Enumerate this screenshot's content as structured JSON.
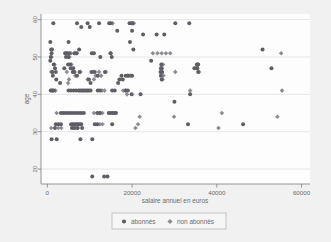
{
  "figure": {
    "background_color": "#f1f1f1",
    "plot_background_color": "#fdfdfd"
  },
  "axes": {
    "x_title": "salaire annuel en euros",
    "y_title": "age",
    "x_ticks": [
      "0",
      "20000",
      "40000",
      "60000"
    ],
    "y_ticks": [
      "20",
      "30",
      "40",
      "50",
      "60"
    ]
  },
  "legend": {
    "items": [
      {
        "label": "abonnés",
        "marker": "circle",
        "color": "#5e5e66"
      },
      {
        "label": "non abonnés",
        "marker": "diamond",
        "color": "#8c8c92"
      }
    ]
  },
  "chart_data": {
    "type": "scatter",
    "title": "",
    "xlabel": "salaire annuel en euros",
    "ylabel": "age",
    "xlim": [
      -1500,
      62000
    ],
    "ylim": [
      16,
      61.5
    ],
    "xticks": [
      0,
      20000,
      40000,
      60000
    ],
    "yticks": [
      20,
      30,
      40,
      50,
      60
    ],
    "grid": "horizontal",
    "legend_position": "below-axis",
    "series": [
      {
        "name": "abonnés",
        "marker": "circle",
        "color": "#5e5e66",
        "points": [
          [
            1400,
            59
          ],
          [
            7000,
            59
          ],
          [
            9500,
            59
          ],
          [
            12200,
            59
          ],
          [
            14600,
            59
          ],
          [
            15000,
            59
          ],
          [
            19400,
            59
          ],
          [
            19900,
            59
          ],
          [
            20100,
            59
          ],
          [
            30200,
            59
          ],
          [
            33500,
            59
          ],
          [
            8000,
            58
          ],
          [
            10000,
            58
          ],
          [
            16500,
            57
          ],
          [
            20000,
            57
          ],
          [
            22600,
            56
          ],
          [
            25800,
            56
          ],
          [
            27600,
            56
          ],
          [
            700,
            54
          ],
          [
            5000,
            54
          ],
          [
            19500,
            54
          ],
          [
            900,
            52
          ],
          [
            1100,
            52
          ],
          [
            7500,
            52
          ],
          [
            20300,
            52
          ],
          [
            50800,
            52
          ],
          [
            1000,
            51
          ],
          [
            4200,
            51
          ],
          [
            4600,
            51
          ],
          [
            5200,
            51
          ],
          [
            6500,
            51
          ],
          [
            6900,
            51
          ],
          [
            10500,
            51
          ],
          [
            11000,
            51
          ],
          [
            14900,
            51
          ],
          [
            800,
            50
          ],
          [
            4400,
            50
          ],
          [
            5000,
            50
          ],
          [
            12500,
            50
          ],
          [
            15200,
            50
          ],
          [
            700,
            49
          ],
          [
            24500,
            49
          ],
          [
            1500,
            48
          ],
          [
            4900,
            48
          ],
          [
            5400,
            48
          ],
          [
            26900,
            48
          ],
          [
            35300,
            48
          ],
          [
            35500,
            48
          ],
          [
            35600,
            48
          ],
          [
            52900,
            47
          ],
          [
            1800,
            47
          ],
          [
            4000,
            47
          ],
          [
            5500,
            47
          ],
          [
            6100,
            47
          ],
          [
            26800,
            47
          ],
          [
            27000,
            47
          ],
          [
            34700,
            47
          ],
          [
            35100,
            47
          ],
          [
            35400,
            47
          ],
          [
            1200,
            46
          ],
          [
            2000,
            46
          ],
          [
            6000,
            46
          ],
          [
            6400,
            46
          ],
          [
            7600,
            46
          ],
          [
            10400,
            46
          ],
          [
            11200,
            46
          ],
          [
            13600,
            46
          ],
          [
            26700,
            46
          ],
          [
            27100,
            46
          ],
          [
            35600,
            46
          ],
          [
            1300,
            45
          ],
          [
            7000,
            45
          ],
          [
            11900,
            45
          ],
          [
            17500,
            45
          ],
          [
            18500,
            45
          ],
          [
            19200,
            45
          ],
          [
            20000,
            45
          ],
          [
            26800,
            45
          ],
          [
            2100,
            44
          ],
          [
            9800,
            44
          ],
          [
            17000,
            44
          ],
          [
            17800,
            44
          ],
          [
            27000,
            44
          ],
          [
            3000,
            43
          ],
          [
            10200,
            43
          ],
          [
            16700,
            43
          ],
          [
            800,
            41
          ],
          [
            1100,
            41
          ],
          [
            1500,
            41
          ],
          [
            5000,
            41
          ],
          [
            5600,
            41
          ],
          [
            6200,
            41
          ],
          [
            6800,
            41
          ],
          [
            7400,
            41
          ],
          [
            8000,
            41
          ],
          [
            8600,
            41
          ],
          [
            9200,
            41
          ],
          [
            9800,
            41
          ],
          [
            10200,
            41
          ],
          [
            11900,
            41
          ],
          [
            12400,
            41
          ],
          [
            15300,
            41
          ],
          [
            15900,
            41
          ],
          [
            18500,
            41
          ],
          [
            19000,
            41
          ],
          [
            19900,
            40
          ],
          [
            22000,
            40
          ],
          [
            33700,
            40
          ],
          [
            30000,
            38
          ],
          [
            3200,
            35
          ],
          [
            3800,
            35
          ],
          [
            4400,
            35
          ],
          [
            5000,
            35
          ],
          [
            5600,
            35
          ],
          [
            6200,
            35
          ],
          [
            6800,
            35
          ],
          [
            7400,
            35
          ],
          [
            8000,
            35
          ],
          [
            8600,
            35
          ],
          [
            11800,
            35
          ],
          [
            12400,
            35
          ],
          [
            14500,
            35
          ],
          [
            15000,
            35
          ],
          [
            15400,
            35
          ],
          [
            15800,
            35
          ],
          [
            16200,
            35
          ],
          [
            2000,
            32
          ],
          [
            2600,
            32
          ],
          [
            3200,
            32
          ],
          [
            5600,
            32
          ],
          [
            6000,
            32
          ],
          [
            6400,
            32
          ],
          [
            6800,
            32
          ],
          [
            7200,
            32
          ],
          [
            7600,
            32
          ],
          [
            8000,
            32
          ],
          [
            11200,
            32
          ],
          [
            11800,
            32
          ],
          [
            15300,
            32
          ],
          [
            33200,
            32
          ],
          [
            46200,
            32
          ],
          [
            1800,
            31
          ],
          [
            5800,
            31
          ],
          [
            6300,
            31
          ],
          [
            7100,
            31
          ],
          [
            8200,
            31
          ],
          [
            1000,
            28
          ],
          [
            2200,
            28
          ],
          [
            7800,
            28
          ],
          [
            10600,
            28
          ],
          [
            10600,
            18
          ],
          [
            13400,
            18
          ],
          [
            14200,
            18
          ]
        ]
      },
      {
        "name": "non abonnés",
        "marker": "diamond",
        "color": "#8c8c92",
        "points": [
          [
            15400,
            59
          ],
          [
            20400,
            59
          ],
          [
            55200,
            51
          ],
          [
            4300,
            51
          ],
          [
            4800,
            51
          ],
          [
            5600,
            51
          ],
          [
            6300,
            51
          ],
          [
            7000,
            51
          ],
          [
            15000,
            51
          ],
          [
            24900,
            51
          ],
          [
            26000,
            51
          ],
          [
            27000,
            51
          ],
          [
            28000,
            51
          ],
          [
            29000,
            51
          ],
          [
            1000,
            50
          ],
          [
            5200,
            50
          ],
          [
            1700,
            48
          ],
          [
            5700,
            48
          ],
          [
            27300,
            48
          ],
          [
            900,
            46
          ],
          [
            4600,
            46
          ],
          [
            7800,
            46
          ],
          [
            10800,
            46
          ],
          [
            12200,
            46
          ],
          [
            13800,
            46
          ],
          [
            30200,
            46
          ],
          [
            35800,
            46
          ],
          [
            6600,
            45
          ],
          [
            11400,
            45
          ],
          [
            12700,
            45
          ],
          [
            18900,
            45
          ],
          [
            19700,
            45
          ],
          [
            27400,
            45
          ],
          [
            5100,
            44
          ],
          [
            9500,
            44
          ],
          [
            11000,
            44
          ],
          [
            27200,
            44
          ],
          [
            4900,
            43
          ],
          [
            1300,
            41
          ],
          [
            1900,
            41
          ],
          [
            7700,
            41
          ],
          [
            8300,
            41
          ],
          [
            8900,
            41
          ],
          [
            9500,
            41
          ],
          [
            12900,
            41
          ],
          [
            13500,
            41
          ],
          [
            17900,
            41
          ],
          [
            18400,
            41
          ],
          [
            33700,
            41
          ],
          [
            55400,
            41
          ],
          [
            18800,
            40
          ],
          [
            41200,
            35
          ],
          [
            2200,
            35
          ],
          [
            11000,
            35
          ],
          [
            12500,
            35
          ],
          [
            13000,
            35
          ],
          [
            21800,
            34
          ],
          [
            29900,
            34
          ],
          [
            54300,
            34
          ],
          [
            900,
            31
          ],
          [
            2600,
            31
          ],
          [
            3300,
            31
          ],
          [
            6600,
            31
          ],
          [
            7200,
            31
          ],
          [
            20800,
            31
          ],
          [
            40400,
            31
          ],
          [
            21400,
            32
          ],
          [
            13000,
            32
          ],
          [
            12400,
            32
          ]
        ]
      }
    ]
  }
}
